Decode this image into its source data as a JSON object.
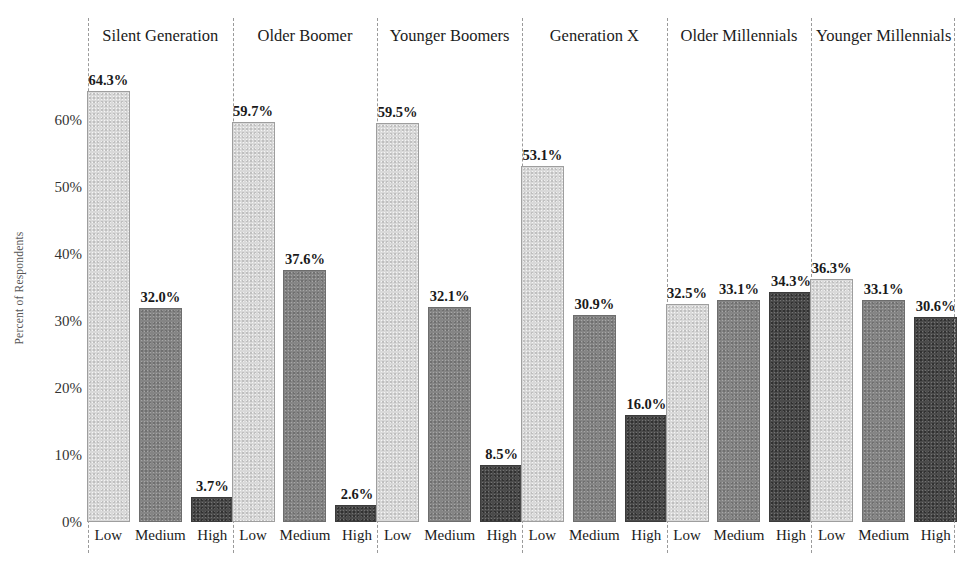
{
  "chart_data": {
    "type": "bar",
    "title": "",
    "subtitle": "",
    "xlabel": "",
    "ylabel": "Percent of Respondents",
    "ylim": [
      0,
      70
    ],
    "ytick_values": [
      0,
      10,
      20,
      30,
      40,
      50,
      60
    ],
    "ytick_labels": [
      "0%",
      "10%",
      "20%",
      "30%",
      "40%",
      "50%",
      "60%"
    ],
    "grid": false,
    "legend": "none",
    "categories": [
      "Low",
      "Medium",
      "High"
    ],
    "panel_label_position": "top",
    "value_label_format": "0.0%",
    "panels": [
      {
        "name": "Silent Generation",
        "values": [
          64.3,
          32.0,
          3.7
        ],
        "labels": [
          "64.3%",
          "32.0%",
          "3.7%"
        ]
      },
      {
        "name": "Older Boomer",
        "values": [
          59.7,
          37.6,
          2.6
        ],
        "labels": [
          "59.7%",
          "37.6%",
          "2.6%"
        ]
      },
      {
        "name": "Younger Boomers",
        "values": [
          59.5,
          32.1,
          8.5
        ],
        "labels": [
          "59.5%",
          "32.1%",
          "8.5%"
        ]
      },
      {
        "name": "Generation X",
        "values": [
          53.1,
          30.9,
          16.0
        ],
        "labels": [
          "53.1%",
          "30.9%",
          "16.0%"
        ]
      },
      {
        "name": "Older Millennials",
        "values": [
          32.5,
          33.1,
          34.3
        ],
        "labels": [
          "32.5%",
          "33.1%",
          "34.3%"
        ]
      },
      {
        "name": "Younger Millennials",
        "values": [
          36.3,
          33.1,
          30.6
        ],
        "labels": [
          "36.3%",
          "33.1%",
          "30.6%"
        ]
      }
    ],
    "series_colors": {
      "Low": "#d9d9d9",
      "Medium": "#858585",
      "High": "#4b4b4b"
    },
    "divider_color": "#9a9a9a",
    "text_color": "#1a1a1a",
    "axis_label_color": "#555555",
    "background": "#ffffff"
  }
}
